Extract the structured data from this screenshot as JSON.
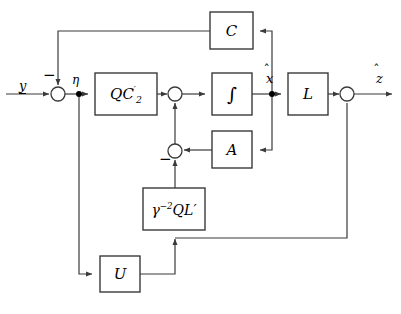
{
  "diagram": {
    "type": "control-block-diagram",
    "stroke_color": "#3a3a3a",
    "text_color": "#000000",
    "background": "#ffffff",
    "blocks": [
      {
        "id": "C",
        "label": "C",
        "x": 210,
        "y": 12,
        "w": 43,
        "h": 37,
        "font_size": 15
      },
      {
        "id": "QC2",
        "label": "QC′2",
        "x": 95,
        "y": 73,
        "w": 62,
        "h": 42,
        "font_size": 15
      },
      {
        "id": "INT",
        "label": "∫",
        "x": 212,
        "y": 73,
        "w": 40,
        "h": 42,
        "font_size": 19
      },
      {
        "id": "L",
        "label": "L",
        "x": 288,
        "y": 73,
        "w": 40,
        "h": 42,
        "font_size": 15
      },
      {
        "id": "A",
        "label": "A",
        "x": 212,
        "y": 131,
        "w": 40,
        "h": 37,
        "font_size": 15
      },
      {
        "id": "G2QL",
        "label": "γ⁻²QL′",
        "x": 143,
        "y": 188,
        "w": 62,
        "h": 42,
        "font_size": 13
      },
      {
        "id": "U",
        "label": "U",
        "x": 100,
        "y": 256,
        "w": 40,
        "h": 36,
        "font_size": 15
      }
    ],
    "junctions": [
      {
        "id": "sum-input",
        "name": "summing-junction-input",
        "cx": 58,
        "cy": 94,
        "r": 7
      },
      {
        "id": "sum-mid",
        "name": "summing-junction-state",
        "cx": 175,
        "cy": 94,
        "r": 7
      },
      {
        "id": "sum-lower",
        "name": "summing-junction-lower",
        "cx": 175,
        "cy": 151,
        "r": 7
      },
      {
        "id": "sum-output",
        "name": "summing-junction-output",
        "cx": 347,
        "cy": 94,
        "r": 7
      }
    ],
    "nodes": [
      {
        "id": "node-eta",
        "name": "node-eta",
        "cx": 79,
        "cy": 94,
        "r": 3
      },
      {
        "id": "node-xhat",
        "name": "node-xhat",
        "cx": 272,
        "cy": 94,
        "r": 3
      }
    ],
    "signal_labels": [
      {
        "id": "y",
        "text": "y",
        "x": 19,
        "y": 79,
        "underline": true,
        "hat": false,
        "font_size": 13
      },
      {
        "id": "eta",
        "text": "η",
        "x": 73,
        "y": 74,
        "underline": false,
        "hat": false,
        "font_size": 12
      },
      {
        "id": "xhat",
        "text": "x",
        "x": 266,
        "y": 71,
        "underline": false,
        "hat": true,
        "font_size": 13
      },
      {
        "id": "zhat",
        "text": "z",
        "x": 376,
        "y": 71,
        "underline": false,
        "hat": true,
        "font_size": 13
      }
    ],
    "sign_markers": [
      {
        "id": "minus-input",
        "text": "−",
        "x": 44,
        "y": 72,
        "font_size": 14
      },
      {
        "id": "minus-lower",
        "text": "−",
        "x": 160,
        "y": 156,
        "font_size": 14
      }
    ],
    "connections": [
      {
        "from": "y-input",
        "to": "sum-input",
        "desc": "input y into summing junction"
      },
      {
        "from": "sum-input",
        "to": "node-eta",
        "desc": "error signal eta"
      },
      {
        "from": "node-eta",
        "to": "QC2",
        "desc": "eta into QC2-prime gain"
      },
      {
        "from": "QC2",
        "to": "sum-mid",
        "desc": "QC2-prime output into state summer"
      },
      {
        "from": "sum-mid",
        "to": "INT",
        "desc": "state derivative into integrator"
      },
      {
        "from": "INT",
        "to": "node-xhat",
        "desc": "integrator output x-hat"
      },
      {
        "from": "node-xhat",
        "to": "L",
        "desc": "x-hat into L gain"
      },
      {
        "from": "L",
        "to": "sum-output",
        "desc": "L output into output summer"
      },
      {
        "from": "sum-output",
        "to": "z-output",
        "desc": "output z-hat"
      },
      {
        "from": "node-xhat",
        "to": "C",
        "desc": "x-hat feedback up into C"
      },
      {
        "from": "C",
        "to": "sum-input",
        "desc": "C output negative feedback to input summer"
      },
      {
        "from": "node-xhat",
        "to": "A",
        "desc": "x-hat into A gain"
      },
      {
        "from": "A",
        "to": "sum-lower",
        "desc": "A output into lower summer"
      },
      {
        "from": "sum-lower",
        "to": "sum-mid",
        "desc": "lower summer result up into state summer"
      },
      {
        "from": "G2QL",
        "to": "sum-lower",
        "desc": "gamma^-2 Q L-prime output negative into lower summer"
      },
      {
        "from": "U",
        "to": "G2QL",
        "desc": "U output up into gamma block"
      },
      {
        "from": "node-eta",
        "to": "U",
        "desc": "eta down into U"
      },
      {
        "from": "sum-output",
        "to": "G2QL",
        "desc": "output feedback down and left into gamma path"
      }
    ]
  }
}
